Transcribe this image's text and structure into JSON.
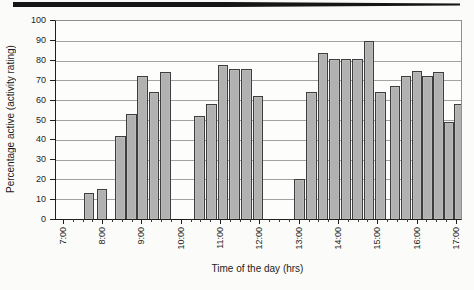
{
  "chart_data": {
    "type": "bar",
    "title": "",
    "xlabel": "Time of the day (hrs)",
    "ylabel": "Percentage active (activity rating)",
    "x_axis": {
      "start_hour": 7,
      "end_hour": 17,
      "tick_labels": [
        "7:00",
        "8:00",
        "9:00",
        "10:00",
        "11:00",
        "12:00",
        "13:00",
        "14:00",
        "15:00",
        "16:00",
        "17:00"
      ],
      "minor_ticks_per_hour": 4
    },
    "y_axis": {
      "min": 0,
      "max": 100,
      "step": 10,
      "tick_labels": [
        "0",
        "10",
        "20",
        "30",
        "40",
        "50",
        "60",
        "70",
        "80",
        "90",
        "100"
      ]
    },
    "bars": [
      {
        "t": 7.64,
        "v": 13
      },
      {
        "t": 7.97,
        "v": 15
      },
      {
        "t": 8.45,
        "v": 42
      },
      {
        "t": 8.73,
        "v": 53
      },
      {
        "t": 9.01,
        "v": 72
      },
      {
        "t": 9.3,
        "v": 64
      },
      {
        "t": 9.59,
        "v": 74
      },
      {
        "t": 10.46,
        "v": 52
      },
      {
        "t": 10.76,
        "v": 58
      },
      {
        "t": 11.06,
        "v": 78
      },
      {
        "t": 11.36,
        "v": 76
      },
      {
        "t": 11.66,
        "v": 76
      },
      {
        "t": 11.95,
        "v": 62
      },
      {
        "t": 13.01,
        "v": 20
      },
      {
        "t": 13.31,
        "v": 64
      },
      {
        "t": 13.61,
        "v": 84
      },
      {
        "t": 13.91,
        "v": 81
      },
      {
        "t": 14.2,
        "v": 81
      },
      {
        "t": 14.49,
        "v": 81
      },
      {
        "t": 14.78,
        "v": 90
      },
      {
        "t": 15.07,
        "v": 64
      },
      {
        "t": 15.45,
        "v": 67
      },
      {
        "t": 15.73,
        "v": 72
      },
      {
        "t": 16.01,
        "v": 75
      },
      {
        "t": 16.28,
        "v": 72
      },
      {
        "t": 16.55,
        "v": 74
      },
      {
        "t": 16.82,
        "v": 49
      },
      {
        "t": 17.09,
        "v": 58
      }
    ],
    "grid": "horizontal",
    "legend": "none",
    "colors": {
      "bar_fill": "#b1b1b1",
      "bar_border": "#3e3e3e",
      "gridline": "#a2a2a2",
      "axis": "#1f1f1f",
      "text": "#1e1e1e",
      "background": "#fbfbf9"
    }
  }
}
